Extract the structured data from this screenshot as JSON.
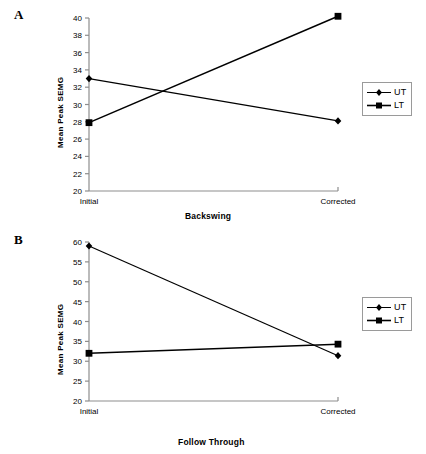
{
  "figure": {
    "panels": [
      {
        "panel_label": "A",
        "legend": {
          "entries": [
            "UT",
            "LT"
          ]
        }
      },
      {
        "panel_label": "B",
        "legend": {
          "entries": [
            "UT",
            "LT"
          ]
        }
      }
    ]
  },
  "chart_data": [
    {
      "type": "line",
      "title": "",
      "panel": "A",
      "xlabel": "Backswing",
      "ylabel": "Mean Peak SEMG",
      "categories": [
        "Initial",
        "Corrected"
      ],
      "x": [
        "Initial",
        "Corrected"
      ],
      "ylim": [
        20,
        40
      ],
      "yticks": [
        20,
        22,
        24,
        26,
        28,
        30,
        32,
        34,
        36,
        38,
        40
      ],
      "ytick_labels": [
        "20",
        "22",
        "24",
        "26",
        "28",
        "30",
        "32",
        "34",
        "36",
        "38",
        "40"
      ],
      "grid": false,
      "legend_position": "right",
      "series": [
        {
          "name": "UT",
          "marker": "diamond",
          "color": "#000000",
          "values": [
            33.0,
            28.1
          ]
        },
        {
          "name": "LT",
          "marker": "square",
          "color": "#000000",
          "values": [
            27.9,
            40.2
          ]
        }
      ]
    },
    {
      "type": "line",
      "title": "",
      "panel": "B",
      "xlabel": "Follow Through",
      "ylabel": "Mean Peak SEMG",
      "categories": [
        "Initial",
        "Corrected"
      ],
      "x": [
        "Initial",
        "Corrected"
      ],
      "ylim": [
        20,
        60
      ],
      "yticks": [
        20,
        25,
        30,
        35,
        40,
        45,
        50,
        55,
        60
      ],
      "ytick_labels": [
        "20",
        "25",
        "30",
        "35",
        "40",
        "45",
        "50",
        "55",
        "60"
      ],
      "grid": false,
      "legend_position": "right",
      "series": [
        {
          "name": "UT",
          "marker": "diamond",
          "color": "#000000",
          "values": [
            59.0,
            31.4
          ]
        },
        {
          "name": "LT",
          "marker": "square",
          "color": "#000000",
          "values": [
            32.0,
            34.3
          ]
        }
      ]
    }
  ]
}
